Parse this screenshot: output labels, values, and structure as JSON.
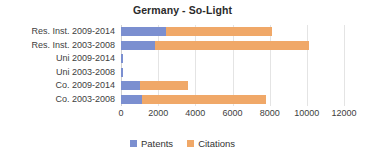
{
  "chart_data": {
    "type": "bar",
    "orientation": "horizontal",
    "stacked": true,
    "title": "Germany - So-Light",
    "xlabel": "",
    "ylabel": "",
    "xlim": [
      0,
      12000
    ],
    "xticks": [
      0,
      2000,
      4000,
      6000,
      8000,
      10000,
      12000
    ],
    "xtick_labels": [
      "0",
      "2000",
      "4000",
      "6000",
      "8000",
      "10000",
      "12000"
    ],
    "grid": true,
    "legend_position": "bottom",
    "categories": [
      "Res. Inst. 2009-2014",
      "Res. Inst. 2003-2008",
      "Uni 2009-2014",
      "Uni 2003-2008",
      "Co. 2009-2014",
      "Co. 2003-2008"
    ],
    "series": [
      {
        "name": "Patents",
        "color": "#7b8fd0",
        "values": [
          2400,
          1850,
          100,
          110,
          1000,
          1150
        ]
      },
      {
        "name": "Citations",
        "color": "#f0a868",
        "values": [
          5700,
          8250,
          0,
          0,
          2600,
          6650
        ]
      }
    ],
    "totals": [
      8100,
      10100,
      100,
      110,
      3600,
      7800
    ]
  },
  "legend": {
    "items": [
      {
        "label": "Patents",
        "color": "#7b8fd0"
      },
      {
        "label": "Citations",
        "color": "#f0a868"
      }
    ]
  }
}
